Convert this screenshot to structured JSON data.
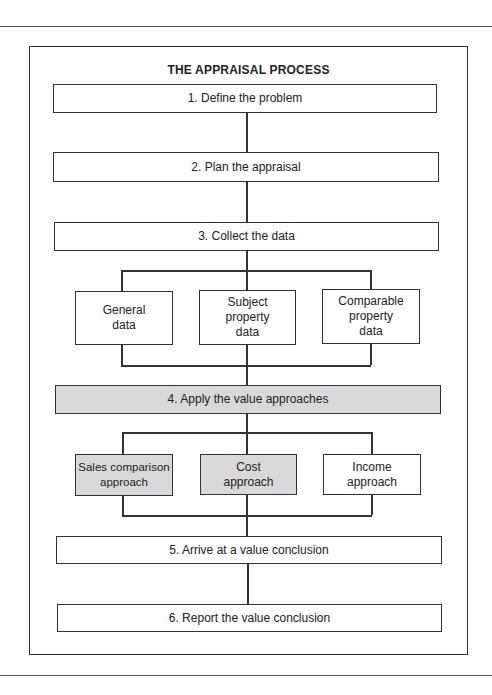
{
  "diagram": {
    "title": "THE APPRAISAL PROCESS",
    "steps": [
      {
        "label": "1. Define the problem",
        "shaded": false
      },
      {
        "label": "2. Plan the appraisal",
        "shaded": false
      },
      {
        "label": "3. Collect the data",
        "shaded": false
      },
      {
        "label": "4. Apply the value approaches",
        "shaded": true
      },
      {
        "label": "5. Arrive at a value conclusion",
        "shaded": false
      },
      {
        "label": "6. Report the value conclusion",
        "shaded": false
      }
    ],
    "data_types": [
      {
        "label": "General data"
      },
      {
        "label": "Subject property data"
      },
      {
        "label": "Comparable property data"
      }
    ],
    "approaches": [
      {
        "label": "Sales comparison approach",
        "shaded": true
      },
      {
        "label": "Cost approach",
        "shaded": true
      },
      {
        "label": "Income approach",
        "shaded": false
      }
    ],
    "colors": {
      "line": "#333333",
      "shade": "#d9d9d9",
      "background": "#ffffff"
    }
  }
}
